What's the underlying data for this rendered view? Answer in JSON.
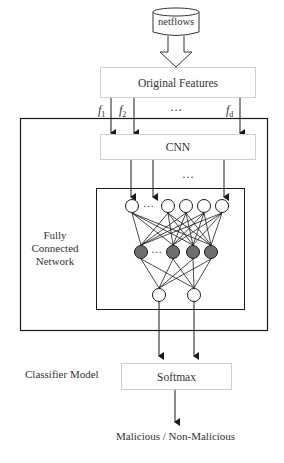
{
  "diagram": {
    "source": {
      "label": "netflows",
      "shape": "cylinder"
    },
    "features_box": {
      "label": "Original Features"
    },
    "feature_labels": [
      {
        "base": "f",
        "sub": "1"
      },
      {
        "base": "f",
        "sub": "2"
      },
      {
        "base": "f",
        "sub": "d"
      }
    ],
    "feature_ellipsis": "…",
    "cnn_box": {
      "label": "CNN"
    },
    "cnn_ellipsis": "…",
    "fc_network": {
      "label_lines": [
        "Fully",
        "Connected",
        "Network"
      ],
      "input_layer": {
        "visible_nodes": 5,
        "has_ellipsis": true,
        "fill": "#ffffff"
      },
      "hidden_layer": {
        "visible_nodes": 4,
        "has_ellipsis": true,
        "fill": "#6e6e6e"
      },
      "output_layer": {
        "visible_nodes": 2,
        "fill": "#ffffff"
      },
      "ellipsis": "…"
    },
    "classifier_label": "Classifier Model",
    "softmax_box": {
      "label": "Softmax"
    },
    "output_label": "Malicious / Non-Malicious",
    "colors": {
      "line": "#1a1a1a",
      "box_border": "#cfcfcf",
      "hidden_node": "#6e6e6e"
    }
  }
}
